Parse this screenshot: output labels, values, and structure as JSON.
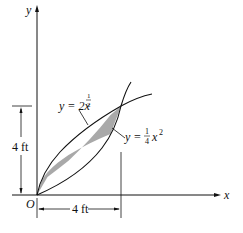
{
  "diagram": {
    "axes": {
      "x_label": "x",
      "y_label": "y",
      "origin_label": "O"
    },
    "curves": [
      {
        "name": "upper",
        "label_prefix": "y = 2x",
        "exponent_num": "1",
        "exponent_den": "2"
      },
      {
        "name": "lower",
        "label_prefix": "y = ",
        "coef_num": "1",
        "coef_den": "4",
        "var": "x",
        "exponent": "2"
      }
    ],
    "dimensions": {
      "vertical": "4 ft",
      "horizontal": "4 ft"
    },
    "colors": {
      "shade": "#a9a9a9",
      "line": "#111111"
    }
  }
}
